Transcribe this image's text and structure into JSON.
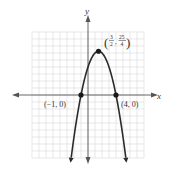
{
  "chart_data": {
    "type": "line",
    "title": "",
    "xlabel": "x",
    "ylabel": "y",
    "function": "y = -(x + 1)(x - 4)",
    "equation_coefficients": {
      "a": -1,
      "b": 3,
      "c": 4
    },
    "xlim": [
      -8,
      8
    ],
    "ylim": [
      -9,
      9
    ],
    "grid": true,
    "curve_domain": [
      -2.4,
      5.4
    ],
    "points": [
      {
        "x": -1,
        "y": 0,
        "label": "(−1, 0)",
        "label_side": "left"
      },
      {
        "x": 4,
        "y": 0,
        "label": "(4, 0)",
        "label_side": "right"
      },
      {
        "x": 1.5,
        "y": 6.25,
        "label_num_x": "3",
        "label_den_x": "2",
        "label_num_y": "25",
        "label_den_y": "4",
        "label_side": "top-right",
        "name": "vertex"
      }
    ]
  },
  "colors": {
    "grid": "#d9d9d9",
    "axis": "#555555",
    "curve": "#2a2a2a",
    "point": "#1a1a1a"
  }
}
